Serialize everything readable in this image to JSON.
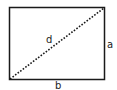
{
  "diagram": {
    "type": "rectangle-with-diagonal",
    "labels": {
      "diagonal": "d",
      "height": "a",
      "width": "b"
    },
    "colors": {
      "stroke": "#1a1a1a",
      "background": "#ffffff"
    }
  }
}
